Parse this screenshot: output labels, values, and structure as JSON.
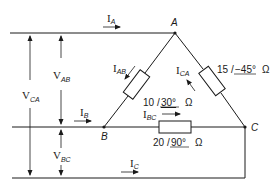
{
  "diagram": {
    "type": "delta-connected three-phase load",
    "nodes": {
      "a": "A",
      "b": "B",
      "c": "C"
    },
    "line_currents": {
      "ia": {
        "main": "I",
        "sub": "A"
      },
      "ib": {
        "main": "I",
        "sub": "B"
      },
      "ic": {
        "main": "I",
        "sub": "C"
      }
    },
    "phase_currents": {
      "iab": {
        "main": "I",
        "sub": "AB"
      },
      "ibc": {
        "main": "I",
        "sub": "BC"
      },
      "ica": {
        "main": "I",
        "sub": "CA"
      }
    },
    "voltages": {
      "vab": {
        "main": "V",
        "sub": "AB"
      },
      "vbc": {
        "main": "V",
        "sub": "BC"
      },
      "vca": {
        "main": "V",
        "sub": "CA"
      }
    },
    "impedances": {
      "zab": {
        "mag": "10",
        "angle": "30°",
        "unit": "Ω"
      },
      "zca": {
        "mag": "15",
        "angle": "−45°",
        "unit": "Ω"
      },
      "zbc": {
        "mag": "20",
        "angle": "90°",
        "unit": "Ω"
      }
    },
    "angle_symbol": "/"
  }
}
